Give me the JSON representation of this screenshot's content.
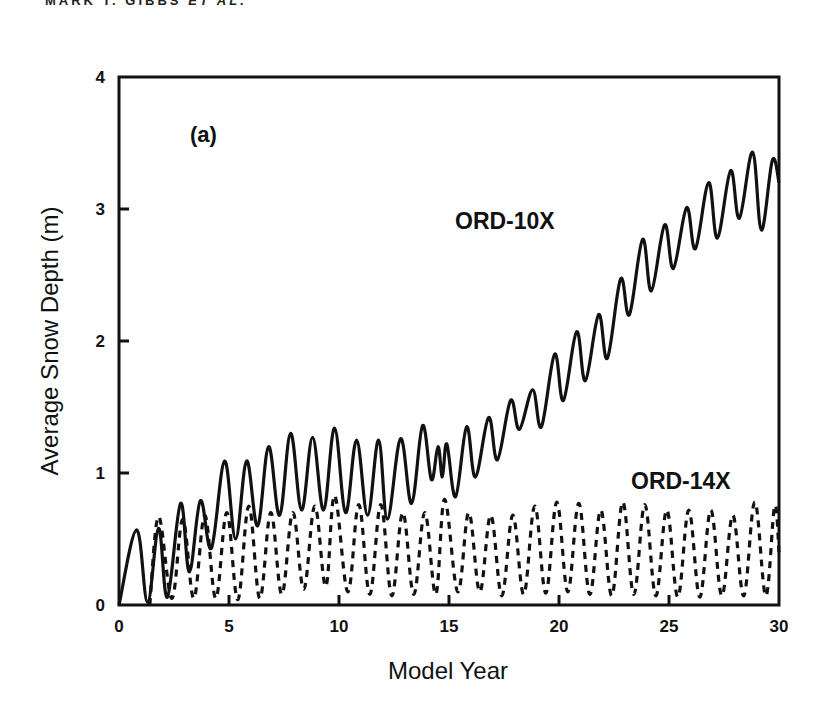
{
  "header": {
    "running_head_author": "MARK T. GIBBS",
    "running_head_etal": "ET AL."
  },
  "chart_data": {
    "type": "line",
    "title": "",
    "panel_label": "(a)",
    "xlabel": "Model Year",
    "ylabel": "Average Snow Depth (m)",
    "xlim": [
      0,
      30
    ],
    "ylim": [
      0,
      4
    ],
    "xticks": [
      0,
      5,
      10,
      15,
      20,
      25,
      30
    ],
    "yticks": [
      0,
      1,
      2,
      3,
      4
    ],
    "grid": false,
    "legend": "inline labels",
    "series": [
      {
        "name": "ORD-10X",
        "style": "solid",
        "label_position": {
          "x": 18.0,
          "y": 2.85
        },
        "points": [
          [
            0.0,
            0.0
          ],
          [
            0.8,
            0.57
          ],
          [
            1.3,
            0.02
          ],
          [
            1.8,
            0.58
          ],
          [
            2.2,
            0.06
          ],
          [
            2.8,
            0.77
          ],
          [
            3.2,
            0.25
          ],
          [
            3.7,
            0.79
          ],
          [
            4.2,
            0.43
          ],
          [
            4.8,
            1.09
          ],
          [
            5.3,
            0.5
          ],
          [
            5.8,
            1.09
          ],
          [
            6.3,
            0.6
          ],
          [
            6.8,
            1.2
          ],
          [
            7.3,
            0.68
          ],
          [
            7.8,
            1.3
          ],
          [
            8.3,
            0.72
          ],
          [
            8.8,
            1.27
          ],
          [
            9.3,
            0.72
          ],
          [
            9.8,
            1.34
          ],
          [
            10.3,
            0.7
          ],
          [
            10.8,
            1.25
          ],
          [
            11.3,
            0.68
          ],
          [
            11.8,
            1.25
          ],
          [
            12.2,
            0.65
          ],
          [
            12.8,
            1.26
          ],
          [
            13.3,
            0.77
          ],
          [
            13.8,
            1.36
          ],
          [
            14.2,
            0.95
          ],
          [
            14.5,
            1.2
          ],
          [
            14.7,
            0.97
          ],
          [
            14.9,
            1.22
          ],
          [
            15.3,
            0.82
          ],
          [
            15.8,
            1.35
          ],
          [
            16.2,
            0.97
          ],
          [
            16.8,
            1.42
          ],
          [
            17.2,
            1.1
          ],
          [
            17.8,
            1.55
          ],
          [
            18.2,
            1.33
          ],
          [
            18.8,
            1.63
          ],
          [
            19.2,
            1.35
          ],
          [
            19.8,
            1.9
          ],
          [
            20.2,
            1.55
          ],
          [
            20.8,
            2.07
          ],
          [
            21.2,
            1.7
          ],
          [
            21.8,
            2.2
          ],
          [
            22.2,
            1.87
          ],
          [
            22.8,
            2.47
          ],
          [
            23.2,
            2.2
          ],
          [
            23.8,
            2.77
          ],
          [
            24.2,
            2.38
          ],
          [
            24.8,
            2.88
          ],
          [
            25.2,
            2.55
          ],
          [
            25.8,
            3.01
          ],
          [
            26.2,
            2.7
          ],
          [
            26.8,
            3.2
          ],
          [
            27.2,
            2.78
          ],
          [
            27.8,
            3.29
          ],
          [
            28.2,
            2.93
          ],
          [
            28.8,
            3.43
          ],
          [
            29.2,
            2.84
          ],
          [
            29.7,
            3.37
          ],
          [
            30.0,
            3.2
          ]
        ]
      },
      {
        "name": "ORD-14X",
        "style": "dashed",
        "label_position": {
          "x": 26.0,
          "y": 0.88
        },
        "points": [
          [
            1.4,
            0.0
          ],
          [
            1.8,
            0.67
          ],
          [
            2.4,
            0.05
          ],
          [
            2.9,
            0.65
          ],
          [
            3.4,
            0.05
          ],
          [
            3.9,
            0.68
          ],
          [
            4.4,
            0.05
          ],
          [
            4.9,
            0.7
          ],
          [
            5.4,
            0.04
          ],
          [
            5.9,
            0.75
          ],
          [
            6.4,
            0.05
          ],
          [
            6.9,
            0.7
          ],
          [
            7.4,
            0.08
          ],
          [
            7.9,
            0.7
          ],
          [
            8.4,
            0.12
          ],
          [
            8.9,
            0.75
          ],
          [
            9.4,
            0.14
          ],
          [
            9.8,
            0.83
          ],
          [
            10.4,
            0.1
          ],
          [
            10.9,
            0.76
          ],
          [
            11.4,
            0.08
          ],
          [
            11.9,
            0.76
          ],
          [
            12.4,
            0.07
          ],
          [
            12.9,
            0.7
          ],
          [
            13.4,
            0.08
          ],
          [
            13.9,
            0.7
          ],
          [
            14.4,
            0.08
          ],
          [
            14.8,
            0.8
          ],
          [
            15.4,
            0.1
          ],
          [
            15.9,
            0.7
          ],
          [
            16.4,
            0.1
          ],
          [
            16.9,
            0.68
          ],
          [
            17.4,
            0.07
          ],
          [
            17.9,
            0.68
          ],
          [
            18.4,
            0.08
          ],
          [
            18.9,
            0.75
          ],
          [
            19.4,
            0.09
          ],
          [
            19.9,
            0.78
          ],
          [
            20.4,
            0.1
          ],
          [
            20.9,
            0.77
          ],
          [
            21.4,
            0.08
          ],
          [
            21.9,
            0.72
          ],
          [
            22.4,
            0.07
          ],
          [
            22.9,
            0.78
          ],
          [
            23.4,
            0.08
          ],
          [
            23.9,
            0.76
          ],
          [
            24.4,
            0.07
          ],
          [
            24.9,
            0.72
          ],
          [
            25.4,
            0.06
          ],
          [
            25.9,
            0.72
          ],
          [
            26.4,
            0.06
          ],
          [
            26.9,
            0.72
          ],
          [
            27.4,
            0.07
          ],
          [
            27.9,
            0.68
          ],
          [
            28.4,
            0.07
          ],
          [
            28.9,
            0.78
          ],
          [
            29.4,
            0.07
          ],
          [
            29.8,
            0.75
          ],
          [
            30.0,
            0.4
          ]
        ]
      }
    ]
  },
  "colors": {
    "ink": "#111111",
    "background": "#ffffff"
  }
}
